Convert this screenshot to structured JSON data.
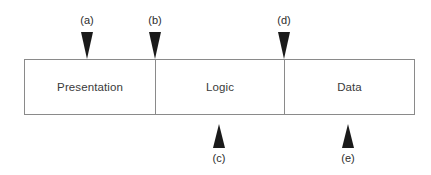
{
  "diagram": {
    "background_color": "#ffffff",
    "border_color": "#8a8a8a",
    "arrow_color": "#1a1a1a",
    "text_color": "#3a3a3a",
    "tiers": [
      {
        "label": "Presentation",
        "width_px": 131
      },
      {
        "label": "Logic",
        "width_px": 129
      },
      {
        "label": "Data",
        "width_px": 129
      }
    ],
    "markers": [
      {
        "id": "a",
        "label": "(a)",
        "direction": "down",
        "position": "above-bar",
        "x_px": 87,
        "points_at": "Presentation tier interior"
      },
      {
        "id": "b",
        "label": "(b)",
        "direction": "down",
        "position": "above-bar",
        "x_px": 155,
        "points_at": "Presentation / Logic boundary"
      },
      {
        "id": "d",
        "label": "(d)",
        "direction": "down",
        "position": "above-bar",
        "x_px": 284,
        "points_at": "Logic / Data boundary"
      },
      {
        "id": "c",
        "label": "(c)",
        "direction": "up",
        "position": "below-bar",
        "x_px": 219,
        "points_at": "Logic tier interior"
      },
      {
        "id": "e",
        "label": "(e)",
        "direction": "up",
        "position": "below-bar",
        "x_px": 348,
        "points_at": "Data tier interior"
      }
    ]
  }
}
